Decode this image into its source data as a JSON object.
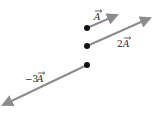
{
  "diagram": {
    "title": "",
    "vectors": [
      {
        "id": "A",
        "label": "A",
        "prefix": "",
        "origin": [
          87,
          28
        ],
        "tip": [
          119,
          14
        ],
        "label_pos": [
          95,
          14
        ]
      },
      {
        "id": "2A",
        "label": "A",
        "prefix": "2",
        "origin": [
          87,
          46
        ],
        "tip": [
          152,
          17
        ],
        "label_pos": [
          119,
          44
        ]
      },
      {
        "id": "neg3A",
        "label": "A",
        "prefix": "−3",
        "origin": [
          87,
          65
        ],
        "tip": [
          1,
          106
        ],
        "label_pos": [
          26,
          80
        ]
      }
    ],
    "colors": {
      "arrow": "#8c8c8c",
      "dot": "#111111",
      "text": "#222222"
    }
  },
  "labels": {
    "a": "A",
    "two_a_prefix": "2",
    "two_a": "A",
    "neg3_a_prefix": "−3",
    "neg3_a": "A"
  }
}
